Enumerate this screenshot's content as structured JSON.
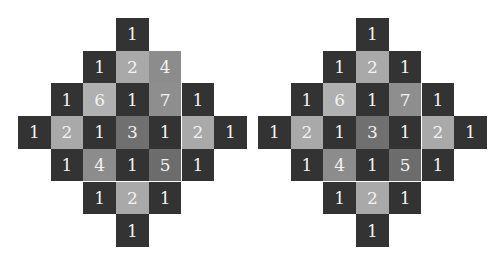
{
  "palette": {
    "1": "#333333",
    "2": "#a9a9a9",
    "3": "#707070",
    "4": "#8c8c8c",
    "5": "#6c6c6c",
    "6": "#b0b0b0",
    "7": "#8e8e8e"
  },
  "diamonds": [
    {
      "name": "left",
      "left": 18,
      "cells": [
        {
          "r": 0,
          "c": 3,
          "v": "1"
        },
        {
          "r": 1,
          "c": 2,
          "v": "1"
        },
        {
          "r": 1,
          "c": 3,
          "v": "2"
        },
        {
          "r": 1,
          "c": 4,
          "v": "4"
        },
        {
          "r": 2,
          "c": 1,
          "v": "1"
        },
        {
          "r": 2,
          "c": 2,
          "v": "6"
        },
        {
          "r": 2,
          "c": 3,
          "v": "1"
        },
        {
          "r": 2,
          "c": 4,
          "v": "7"
        },
        {
          "r": 2,
          "c": 5,
          "v": "1"
        },
        {
          "r": 3,
          "c": 0,
          "v": "1"
        },
        {
          "r": 3,
          "c": 1,
          "v": "2"
        },
        {
          "r": 3,
          "c": 2,
          "v": "1"
        },
        {
          "r": 3,
          "c": 3,
          "v": "3"
        },
        {
          "r": 3,
          "c": 4,
          "v": "1"
        },
        {
          "r": 3,
          "c": 5,
          "v": "2"
        },
        {
          "r": 3,
          "c": 6,
          "v": "1"
        },
        {
          "r": 4,
          "c": 1,
          "v": "1"
        },
        {
          "r": 4,
          "c": 2,
          "v": "4"
        },
        {
          "r": 4,
          "c": 3,
          "v": "1"
        },
        {
          "r": 4,
          "c": 4,
          "v": "5"
        },
        {
          "r": 4,
          "c": 5,
          "v": "1"
        },
        {
          "r": 5,
          "c": 2,
          "v": "1"
        },
        {
          "r": 5,
          "c": 3,
          "v": "2"
        },
        {
          "r": 5,
          "c": 4,
          "v": "1"
        },
        {
          "r": 6,
          "c": 3,
          "v": "1"
        }
      ]
    },
    {
      "name": "right",
      "left": 258,
      "cells": [
        {
          "r": 0,
          "c": 3,
          "v": "1"
        },
        {
          "r": 1,
          "c": 2,
          "v": "1"
        },
        {
          "r": 1,
          "c": 3,
          "v": "2"
        },
        {
          "r": 1,
          "c": 4,
          "v": "1"
        },
        {
          "r": 2,
          "c": 1,
          "v": "1"
        },
        {
          "r": 2,
          "c": 2,
          "v": "6"
        },
        {
          "r": 2,
          "c": 3,
          "v": "1"
        },
        {
          "r": 2,
          "c": 4,
          "v": "7"
        },
        {
          "r": 2,
          "c": 5,
          "v": "1"
        },
        {
          "r": 3,
          "c": 0,
          "v": "1"
        },
        {
          "r": 3,
          "c": 1,
          "v": "2"
        },
        {
          "r": 3,
          "c": 2,
          "v": "1"
        },
        {
          "r": 3,
          "c": 3,
          "v": "3"
        },
        {
          "r": 3,
          "c": 4,
          "v": "1"
        },
        {
          "r": 3,
          "c": 5,
          "v": "2"
        },
        {
          "r": 3,
          "c": 6,
          "v": "1"
        },
        {
          "r": 4,
          "c": 1,
          "v": "1"
        },
        {
          "r": 4,
          "c": 2,
          "v": "4"
        },
        {
          "r": 4,
          "c": 3,
          "v": "1"
        },
        {
          "r": 4,
          "c": 4,
          "v": "5"
        },
        {
          "r": 4,
          "c": 5,
          "v": "1"
        },
        {
          "r": 5,
          "c": 2,
          "v": "1"
        },
        {
          "r": 5,
          "c": 3,
          "v": "2"
        },
        {
          "r": 5,
          "c": 4,
          "v": "1"
        },
        {
          "r": 6,
          "c": 3,
          "v": "1"
        }
      ]
    }
  ]
}
